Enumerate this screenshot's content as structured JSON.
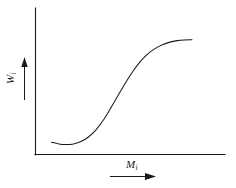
{
  "figure": {
    "background_color": "#ffffff",
    "line_color": "#1a1a1a",
    "axes": {
      "y_axis_name": "vertical-axis-line",
      "x_axis_name": "horizontal-axis-line",
      "ticks_shown": false,
      "tick_labels": [],
      "gridlines": false
    },
    "y_label": {
      "symbol": "W",
      "subscript": "i",
      "arrow": "up-arrow",
      "arrow_direction": "up"
    },
    "x_label": {
      "symbol": "M",
      "subscript": "i",
      "arrow": "right-arrow",
      "arrow_direction": "right"
    }
  },
  "chart_data": {
    "type": "line",
    "title": "",
    "subtitle": "",
    "xlabel": "M_i",
    "ylabel": "W_i",
    "xlim": [
      0,
      1
    ],
    "ylim": [
      0,
      1
    ],
    "grid": false,
    "legend": null,
    "annotations": [],
    "tick_labels": {
      "x": [],
      "y": []
    },
    "series": [
      {
        "name": "sigmoid-curve",
        "shape": "S-shaped monotonic saturating curve with slight initial dip",
        "x": [
          0.05,
          0.1,
          0.15,
          0.2,
          0.25,
          0.3,
          0.35,
          0.4,
          0.45,
          0.5,
          0.55,
          0.6,
          0.65,
          0.7,
          0.75,
          0.8,
          0.85,
          0.9,
          0.95,
          1.0
        ],
        "y": [
          0.055,
          0.04,
          0.035,
          0.04,
          0.06,
          0.1,
          0.16,
          0.245,
          0.35,
          0.46,
          0.57,
          0.67,
          0.755,
          0.82,
          0.868,
          0.902,
          0.925,
          0.938,
          0.944,
          0.946
        ]
      }
    ]
  }
}
